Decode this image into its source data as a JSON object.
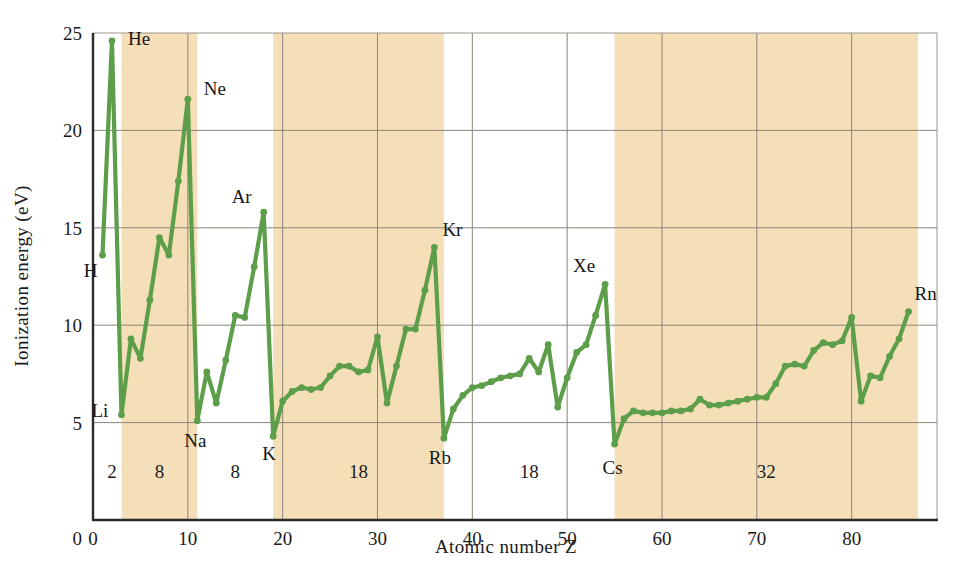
{
  "chart_data": {
    "type": "line",
    "title": "",
    "xlabel": "Atomic number Z",
    "ylabel": "Ionization energy (eV)",
    "xlim": [
      0,
      89
    ],
    "ylim": [
      0,
      25
    ],
    "xticks": [
      0,
      10,
      20,
      30,
      40,
      50,
      60,
      70,
      80
    ],
    "yticks": [
      5,
      10,
      15,
      20,
      25
    ],
    "grid": true,
    "legend": "none",
    "line_color": "#5d9e4a",
    "marker": "circle",
    "series": [
      {
        "name": "First ionization energy",
        "x": [
          1,
          2,
          3,
          4,
          5,
          6,
          7,
          8,
          9,
          10,
          11,
          12,
          13,
          14,
          15,
          16,
          17,
          18,
          19,
          20,
          21,
          22,
          23,
          24,
          25,
          26,
          27,
          28,
          29,
          30,
          31,
          32,
          33,
          34,
          35,
          36,
          37,
          38,
          39,
          40,
          41,
          42,
          43,
          44,
          45,
          46,
          47,
          48,
          49,
          50,
          51,
          52,
          53,
          54,
          55,
          56,
          57,
          58,
          59,
          60,
          61,
          62,
          63,
          64,
          65,
          66,
          67,
          68,
          69,
          70,
          71,
          72,
          73,
          74,
          75,
          76,
          77,
          78,
          79,
          80,
          81,
          82,
          83,
          84,
          85,
          86
        ],
        "values": [
          13.6,
          24.6,
          5.4,
          9.3,
          8.3,
          11.3,
          14.5,
          13.6,
          17.4,
          21.6,
          5.1,
          7.6,
          6.0,
          8.2,
          10.5,
          10.4,
          13.0,
          15.8,
          4.3,
          6.1,
          6.6,
          6.8,
          6.7,
          6.8,
          7.4,
          7.9,
          7.9,
          7.6,
          7.7,
          9.4,
          6.0,
          7.9,
          9.8,
          9.8,
          11.8,
          14.0,
          4.2,
          5.7,
          6.4,
          6.8,
          6.9,
          7.1,
          7.3,
          7.4,
          7.5,
          8.3,
          7.6,
          9.0,
          5.8,
          7.3,
          8.6,
          9.0,
          10.5,
          12.1,
          3.9,
          5.2,
          5.6,
          5.5,
          5.5,
          5.5,
          5.6,
          5.6,
          5.7,
          6.2,
          5.9,
          5.9,
          6.0,
          6.1,
          6.2,
          6.3,
          6.3,
          7.0,
          7.9,
          8.0,
          7.9,
          8.7,
          9.1,
          9.0,
          9.2,
          10.4,
          6.1,
          7.4,
          7.3,
          8.4,
          9.3,
          10.7
        ]
      }
    ],
    "annotations": [
      {
        "label": "H",
        "z": 1,
        "e": 13.6
      },
      {
        "label": "He",
        "z": 2,
        "e": 24.6
      },
      {
        "label": "Li",
        "z": 3,
        "e": 5.4
      },
      {
        "label": "Ne",
        "z": 10,
        "e": 21.6
      },
      {
        "label": "Na",
        "z": 11,
        "e": 5.1
      },
      {
        "label": "Ar",
        "z": 18,
        "e": 15.8
      },
      {
        "label": "K",
        "z": 19,
        "e": 4.3
      },
      {
        "label": "Kr",
        "z": 36,
        "e": 14.0
      },
      {
        "label": "Rb",
        "z": 37,
        "e": 4.2
      },
      {
        "label": "Xe",
        "z": 54,
        "e": 12.1
      },
      {
        "label": "Cs",
        "z": 55,
        "e": 3.9
      },
      {
        "label": "Rn",
        "z": 86,
        "e": 10.7
      }
    ],
    "period_bands": [
      {
        "count": "2",
        "z_start": 1,
        "z_end": 3,
        "shaded": false
      },
      {
        "count": "8",
        "z_start": 3,
        "z_end": 11,
        "shaded": true
      },
      {
        "count": "8",
        "z_start": 11,
        "z_end": 19,
        "shaded": false
      },
      {
        "count": "18",
        "z_start": 19,
        "z_end": 37,
        "shaded": true
      },
      {
        "count": "18",
        "z_start": 37,
        "z_end": 55,
        "shaded": false
      },
      {
        "count": "32",
        "z_start": 55,
        "z_end": 87,
        "shaded": true
      }
    ],
    "band_color": "#f5dfb9",
    "period_label_y": 2.15
  }
}
